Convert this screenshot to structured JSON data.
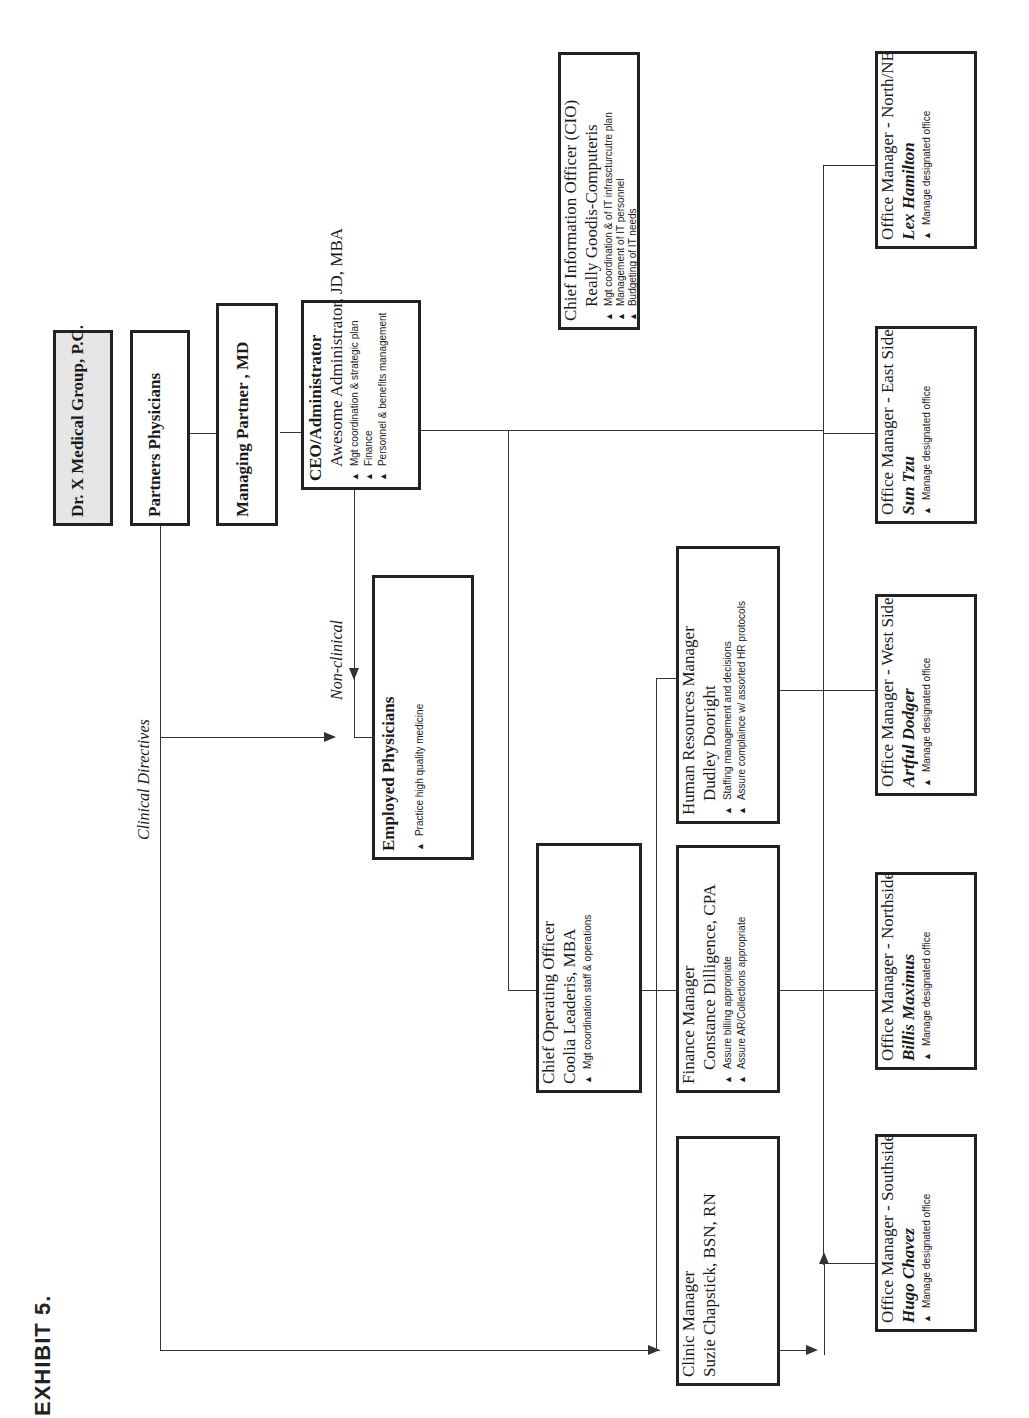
{
  "exhibit_label": "EXHIBIT 5.",
  "nodes": {
    "org": {
      "title": "Dr. X Medical Group, P.C."
    },
    "partners": {
      "title": "Partners Physicians"
    },
    "managing_partner": {
      "title": "Managing Partner , MD"
    },
    "ceo": {
      "title": "CEO/Administrator",
      "name": "Awesome Administrator, JD, MBA",
      "bullets": [
        "Mgt coordination & strategic plan",
        "Finance",
        "Personnel & benefits management"
      ]
    },
    "employed": {
      "title": "Employed Physicians",
      "bullets": [
        "Practice high quality medicine"
      ]
    },
    "cio": {
      "title": "Chief Information Officer (CIO)",
      "name": "Really Goodis-Computeris",
      "bullets": [
        "Mgt coordination & of IT infrascturcutre plan",
        "Management of IT personnel",
        "Budgeting of IT needs"
      ]
    },
    "coo": {
      "title": "Chief Operating Officer",
      "name": "Coolia Leaderis, MBA",
      "bullets": [
        "Mgt coordination staff & operations"
      ]
    },
    "hr": {
      "title": "Human Resources Manager",
      "name": "Dudley Dooright",
      "bullets": [
        "Staffing management and decisions",
        "Assure complaince w/ assorted HR protocols"
      ]
    },
    "finance": {
      "title": "Finance Manager",
      "name": "Constance Dilligence, CPA",
      "bullets": [
        "Assure billing appropriate",
        "Assure AR/Collections appropriate"
      ]
    },
    "clinic": {
      "title": "Clinic Manager",
      "name": "Suzie Chapstick, BSN, RN"
    },
    "om_north_ne": {
      "title": "Office Manager - North/NE",
      "name": "Lex Hamilton",
      "bullets": [
        "Manage designated office"
      ]
    },
    "om_east": {
      "title": "Office Manager - East Side",
      "name": "Sun Tzu",
      "bullets": [
        "Manage designated office"
      ]
    },
    "om_west": {
      "title": "Office Manager - West Side",
      "name": "Artful Dodger",
      "bullets": [
        "Manage designated office"
      ]
    },
    "om_northside": {
      "title": "Office Manager - Northside",
      "name": "Billis Maximus",
      "bullets": [
        "Manage designated office"
      ]
    },
    "om_southside": {
      "title": "Office Manager - Southside",
      "name": "Hugo Chavez",
      "bullets": [
        "Manage designated office"
      ]
    }
  },
  "connector_labels": {
    "clinical": "Clinical Directives",
    "nonclinical": "Non-clinical"
  },
  "bullet_glyph": "▲"
}
